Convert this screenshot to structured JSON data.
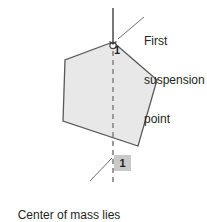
{
  "figure": {
    "title_callouts": {
      "suspension": {
        "lines": [
          "First",
          "suspension",
          "point"
        ],
        "line1": "First",
        "line2": "suspension",
        "line3": "point"
      },
      "center_of_mass": {
        "lines": [
          "Center of mass lies",
          "along this line"
        ],
        "line1": "Center of mass lies",
        "line2": "along this line"
      }
    },
    "labels": {
      "suspension_index_top": "1",
      "suspension_index_box": "1"
    },
    "colors": {
      "shape_fill": "#e8e8e8",
      "shape_stroke": "#58595b",
      "line_solid": "#3f3f3f",
      "line_dashed": "#9a9a9a",
      "leader_line": "#6d6e71",
      "label_box_bg": "#c9c9c9",
      "text": "#231f20",
      "background": "#ffffff"
    },
    "geometry": {
      "suspension_point": {
        "x": 113,
        "y": 42
      },
      "plumb_line_top": {
        "x": 113,
        "y": 8
      },
      "plumb_line_bottom": {
        "x": 113,
        "y": 182
      },
      "shape_vertices": [
        {
          "x": 113,
          "y": 42
        },
        {
          "x": 65,
          "y": 60
        },
        {
          "x": 63,
          "y": 121
        },
        {
          "x": 138,
          "y": 146
        },
        {
          "x": 157,
          "y": 80
        }
      ],
      "leader_suspension": {
        "x1": 144,
        "y1": 17,
        "x2": 118,
        "y2": 39
      },
      "leader_com": {
        "x1": 90,
        "y1": 181,
        "x2": 112,
        "y2": 158
      }
    }
  }
}
